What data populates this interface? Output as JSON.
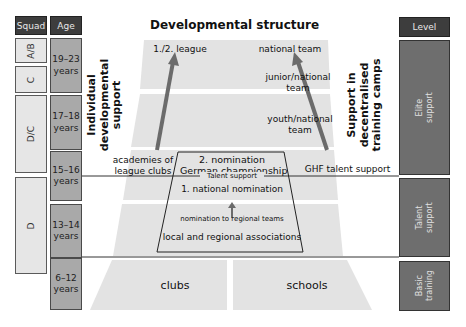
{
  "title": "Developmental structure",
  "columns": {
    "squad_header": "Squad",
    "age_header": "Age",
    "level_header": "Level"
  },
  "squads": [
    {
      "label": "A/B"
    },
    {
      "label": "C"
    },
    {
      "label": "D/C"
    },
    {
      "label": "D"
    }
  ],
  "ages": [
    {
      "line1": "19–23",
      "line2": "years"
    },
    {
      "line1": "17–18",
      "line2": "years"
    },
    {
      "line1": "15–16",
      "line2": "years"
    },
    {
      "line1": "13–14",
      "line2": "years"
    },
    {
      "line1": "6–12",
      "line2": "years"
    }
  ],
  "levels": [
    {
      "line1": "Elite",
      "line2": "support"
    },
    {
      "line1": "Talent",
      "line2": "support"
    },
    {
      "line1": "Basic",
      "line2": "training"
    }
  ],
  "side_labels": {
    "left": {
      "line1": "Individual",
      "line2": "developmental",
      "line3": "support"
    },
    "right": {
      "line1": "Support in",
      "line2": "decentralised",
      "line3": "training camps"
    }
  },
  "pyramid": {
    "league": "1./2. league",
    "national_team": "national team",
    "junior_national": {
      "line1": "junior/national",
      "line2": "team"
    },
    "youth_national": {
      "line1": "youth/national",
      "line2": "team"
    },
    "academies": {
      "line1": "academies of",
      "line2": "league clubs"
    },
    "ghf": "GHF talent support",
    "nomination2": {
      "line1": "2. nomination",
      "line2": "German championship"
    },
    "talent_support": "Talent support",
    "nomination1": "1. national nomination",
    "regional": "nomination to regional teams",
    "associations": "local and regional associations",
    "clubs": "clubs",
    "schools": "schools"
  },
  "colors": {
    "header_bg": "#3d3d3d",
    "squad_bg": "#e6e6e6",
    "age_bg": "#a9a9a9",
    "level_bg": "#6e6e6e",
    "pyramid_band": "#e3e3e3",
    "arrow": "#6b6b6b"
  }
}
